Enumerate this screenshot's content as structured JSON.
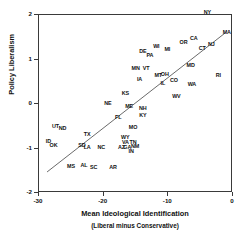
{
  "chart_data": {
    "type": "scatter",
    "title": "",
    "xlabel": "Mean Ideological Identification",
    "xlabel_sub": "(Liberal minus Conservative)",
    "ylabel": "Policy Liberalism",
    "xlim": [
      -30,
      0
    ],
    "ylim": [
      -2,
      2
    ],
    "xticks": [
      -30,
      -20,
      -10,
      0
    ],
    "xticklabels": [
      "-30",
      "-20",
      "-10",
      "0"
    ],
    "yticks": [
      2,
      1,
      0,
      -1,
      -2
    ],
    "yticklabels": [
      "2",
      "1",
      "0",
      "-1",
      "-2"
    ],
    "grid": false,
    "legend": false,
    "point_style": "text-label",
    "fit_line": {
      "label": "least-squares fit",
      "x": [
        -28.6,
        -1.0
      ],
      "y": [
        -1.55,
        1.58
      ]
    },
    "points": [
      {
        "label": "NY",
        "x": -3.8,
        "y": 2.03
      },
      {
        "label": "MA",
        "x": -0.8,
        "y": 1.58
      },
      {
        "label": "CA",
        "x": -5.9,
        "y": 1.43
      },
      {
        "label": "OR",
        "x": -7.5,
        "y": 1.35
      },
      {
        "label": "NJ",
        "x": -3.2,
        "y": 1.3
      },
      {
        "label": "CT",
        "x": -4.6,
        "y": 1.21
      },
      {
        "label": "WI",
        "x": -11.7,
        "y": 1.26
      },
      {
        "label": "MI",
        "x": -10.0,
        "y": 1.19
      },
      {
        "label": "DE",
        "x": -13.8,
        "y": 1.14
      },
      {
        "label": "PA",
        "x": -12.7,
        "y": 1.05
      },
      {
        "label": "MD",
        "x": -6.4,
        "y": 0.84
      },
      {
        "label": "MN",
        "x": -14.9,
        "y": 0.77
      },
      {
        "label": "VT",
        "x": -13.3,
        "y": 0.77
      },
      {
        "label": "MT",
        "x": -11.4,
        "y": 0.6
      },
      {
        "label": "OH",
        "x": -10.4,
        "y": 0.63
      },
      {
        "label": "RI",
        "x": -2.1,
        "y": 0.6
      },
      {
        "label": "IA",
        "x": -14.3,
        "y": 0.52
      },
      {
        "label": "CO",
        "x": -9.0,
        "y": 0.5
      },
      {
        "label": "IL",
        "x": -10.7,
        "y": 0.43
      },
      {
        "label": "WA",
        "x": -6.2,
        "y": 0.41
      },
      {
        "label": "KS",
        "x": -16.5,
        "y": 0.21
      },
      {
        "label": "WV",
        "x": -8.6,
        "y": 0.14
      },
      {
        "label": "NE",
        "x": -19.2,
        "y": -0.03
      },
      {
        "label": "ME",
        "x": -15.9,
        "y": -0.08
      },
      {
        "label": "NH",
        "x": -13.8,
        "y": -0.14
      },
      {
        "label": "KY",
        "x": -13.8,
        "y": -0.3
      },
      {
        "label": "FL",
        "x": -17.6,
        "y": -0.33
      },
      {
        "label": "UT",
        "x": -27.3,
        "y": -0.53
      },
      {
        "label": "ND",
        "x": -26.2,
        "y": -0.59
      },
      {
        "label": "MO",
        "x": -15.3,
        "y": -0.57
      },
      {
        "label": "TX",
        "x": -22.4,
        "y": -0.71
      },
      {
        "label": "WY",
        "x": -16.5,
        "y": -0.78
      },
      {
        "label": "ID",
        "x": -28.4,
        "y": -0.88
      },
      {
        "label": "VA",
        "x": -16.5,
        "y": -0.89
      },
      {
        "label": "TN",
        "x": -15.3,
        "y": -0.89
      },
      {
        "label": "OK",
        "x": -27.6,
        "y": -0.97
      },
      {
        "label": "SD",
        "x": -23.2,
        "y": -0.96
      },
      {
        "label": "LA",
        "x": -22.4,
        "y": -1.02
      },
      {
        "label": "NC",
        "x": -20.2,
        "y": -1.0
      },
      {
        "label": "AZ",
        "x": -17.1,
        "y": -1.0
      },
      {
        "label": "GA",
        "x": -16.2,
        "y": -1.0
      },
      {
        "label": "NM",
        "x": -15.0,
        "y": -0.98
      },
      {
        "label": "IN",
        "x": -15.6,
        "y": -1.09
      },
      {
        "label": "MS",
        "x": -24.9,
        "y": -1.44
      },
      {
        "label": "AL",
        "x": -22.9,
        "y": -1.41
      },
      {
        "label": "SC",
        "x": -21.4,
        "y": -1.47
      },
      {
        "label": "AR",
        "x": -18.4,
        "y": -1.47
      }
    ]
  }
}
